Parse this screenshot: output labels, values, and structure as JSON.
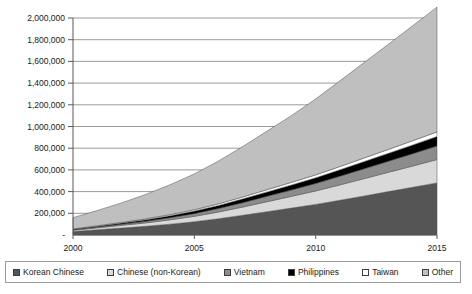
{
  "chart_data": {
    "type": "area",
    "stacked": true,
    "title": "",
    "xlabel": "",
    "ylabel": "",
    "x": [
      2000,
      2001,
      2002,
      2003,
      2004,
      2005,
      2006,
      2007,
      2008,
      2009,
      2010,
      2011,
      2012,
      2013,
      2014,
      2015
    ],
    "xlim": [
      2000,
      2015
    ],
    "ylim": [
      0,
      2000000
    ],
    "ytick_labels": [
      "-",
      "200,000",
      "400,000",
      "600,000",
      "800,000",
      "1,000,000",
      "1,200,000",
      "1,400,000",
      "1,600,000",
      "1,800,000",
      "2,000,000"
    ],
    "ytick_values": [
      0,
      200000,
      400000,
      600000,
      800000,
      1000000,
      1200000,
      1400000,
      1600000,
      1800000,
      2000000
    ],
    "xtick_labels": [
      "2000",
      "2005",
      "2010",
      "2015"
    ],
    "xtick_values": [
      2000,
      2005,
      2010,
      2015
    ],
    "grid": true,
    "legend_position": "bottom",
    "series": [
      {
        "name": "Korean Chinese",
        "color": "#555555",
        "values": [
          32000,
          48000,
          64000,
          80000,
          100000,
          122000,
          150000,
          182000,
          215000,
          248000,
          282000,
          320000,
          360000,
          400000,
          440000,
          480000
        ]
      },
      {
        "name": "Chinese (non-Korean)",
        "color": "#d9d9d9",
        "values": [
          12000,
          18000,
          25000,
          32000,
          40000,
          50000,
          62000,
          76000,
          92000,
          108000,
          124000,
          142000,
          160000,
          178000,
          196000,
          215000
        ]
      },
      {
        "name": "Vietnam",
        "color": "#8c8c8c",
        "values": [
          4000,
          7000,
          10000,
          14000,
          19000,
          25000,
          32000,
          40000,
          49000,
          58000,
          68000,
          79000,
          90000,
          101000,
          113000,
          125000
        ]
      },
      {
        "name": "Philippines",
        "color": "#000000",
        "values": [
          5000,
          8000,
          11000,
          15000,
          19000,
          24000,
          29000,
          35000,
          41000,
          47000,
          53000,
          60000,
          67000,
          74000,
          81000,
          88000
        ]
      },
      {
        "name": "Taiwan",
        "color": "#ffffff",
        "values": [
          3000,
          4500,
          6000,
          8000,
          10000,
          12000,
          15000,
          18000,
          21000,
          24000,
          27000,
          30000,
          33000,
          36000,
          39000,
          42000
        ]
      },
      {
        "name": "Other",
        "color": "#bfbfbf",
        "values": [
          104000,
          140000,
          180000,
          225000,
          275000,
          330000,
          395000,
          465000,
          540000,
          615000,
          700000,
          790000,
          880000,
          970000,
          1060000,
          1150000
        ]
      }
    ]
  },
  "legend": {
    "items": [
      {
        "label": "Korean Chinese",
        "swatch": "legend-swatch-korean-chinese"
      },
      {
        "label": "Chinese (non-Korean)",
        "swatch": "legend-swatch-chinese-non-korean"
      },
      {
        "label": "Vietnam",
        "swatch": "legend-swatch-vietnam"
      },
      {
        "label": "Philippines",
        "swatch": "legend-swatch-philippines"
      },
      {
        "label": "Taiwan",
        "swatch": "legend-swatch-taiwan"
      },
      {
        "label": "Other",
        "swatch": "legend-swatch-other"
      }
    ]
  }
}
